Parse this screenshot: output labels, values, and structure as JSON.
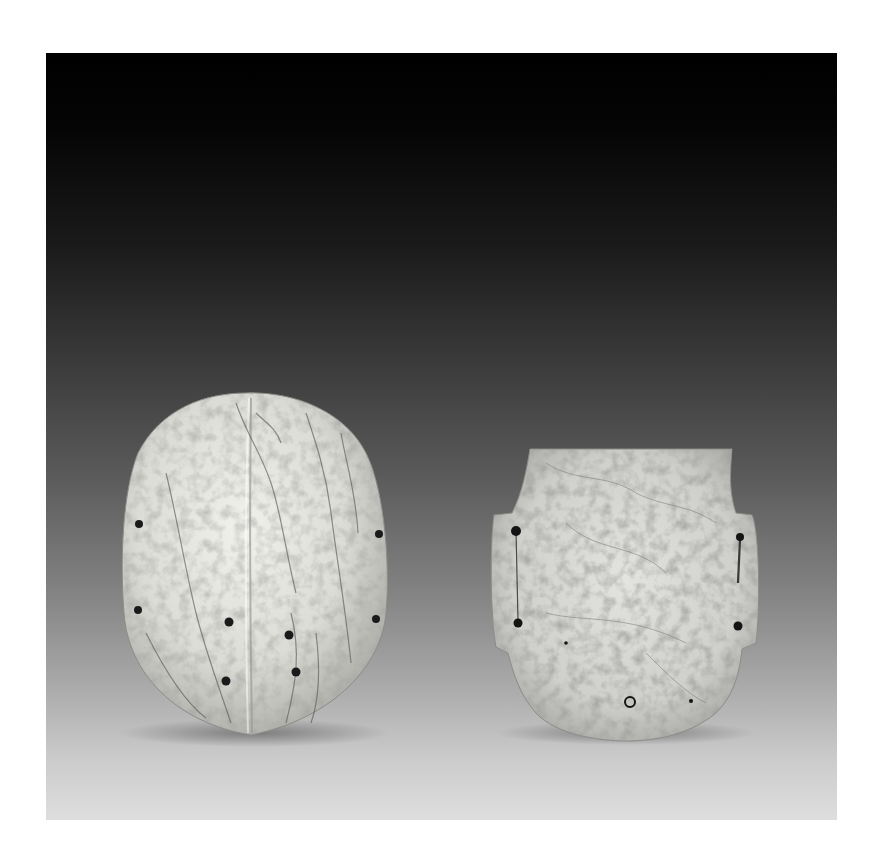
{
  "image": {
    "subject": "Two carved pale stone (jade-like) artifacts photographed against a black-to-light-gray gradient backdrop",
    "background": {
      "top_color": "#000000",
      "bottom_color": "#dedede"
    },
    "objects": [
      {
        "id": "left",
        "description": "Ovoid shield-like plaque with a central vertical ridge, mottled white stone with dark veins",
        "drilled_holes": 8,
        "surface_color": "#dcdcd6",
        "vein_color": "#5a5a58"
      },
      {
        "id": "right",
        "description": "Flat plaque with a flared top, notched shoulders with side flanges, and rounded bottom; speckled gray-white stone",
        "drilled_holes": 5,
        "ring_holes": 1,
        "surface_color": "#cfcfcb",
        "vein_color": "#7a7a76"
      }
    ]
  }
}
